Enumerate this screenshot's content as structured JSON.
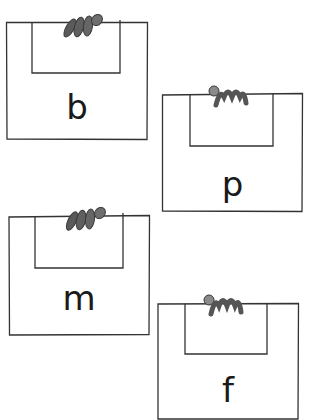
{
  "cards": [
    {
      "letter": "b",
      "x": 6,
      "y": 22,
      "w": 142,
      "h": 118,
      "pocket": {
        "x": 26,
        "w": 88,
        "h": 51
      },
      "hand_x": 56
    },
    {
      "letter": "p",
      "x": 162,
      "y": 93,
      "w": 141,
      "h": 119,
      "pocket": {
        "x": 28,
        "w": 83,
        "h": 53
      },
      "hand_x": 44
    },
    {
      "letter": "m",
      "x": 8,
      "y": 215,
      "w": 142,
      "h": 120,
      "pocket": {
        "x": 27,
        "w": 88,
        "h": 53
      },
      "hand_x": 56
    },
    {
      "letter": "f",
      "x": 157,
      "y": 303,
      "w": 142,
      "h": 115,
      "pocket": {
        "x": 28,
        "w": 82,
        "h": 51
      },
      "hand_x": 44
    }
  ],
  "colors": {
    "stroke": "#333333",
    "hand": "#6e6e6e",
    "hand_dark": "#4a4a4a"
  }
}
